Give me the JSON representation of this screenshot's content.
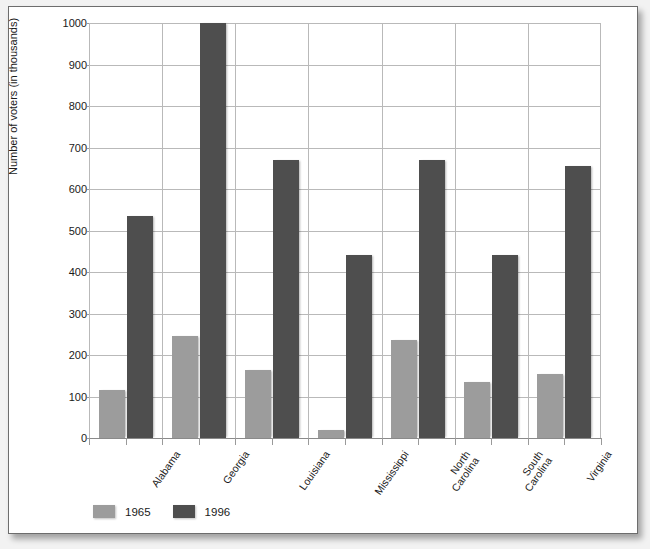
{
  "chart_data": {
    "type": "bar",
    "title": "",
    "xlabel": "",
    "ylabel": "Number of voters (in thousands)",
    "ylim": [
      0,
      1000
    ],
    "ytick_step": 100,
    "yticks": [
      "0",
      "100",
      "200",
      "300",
      "400",
      "500",
      "600",
      "700",
      "800",
      "900",
      "1000"
    ],
    "grid": true,
    "legend_position": "bottom-left",
    "categories": [
      "Alabama",
      "Georgia",
      "Louisiana",
      "Mississippi",
      "North Carolina",
      "South Carolina",
      "Virginia"
    ],
    "category_lines": [
      [
        "Alabama"
      ],
      [
        "Georgia"
      ],
      [
        "Louisiana"
      ],
      [
        "Mississippi"
      ],
      [
        "North",
        "Carolina"
      ],
      [
        "South",
        "Carolina"
      ],
      [
        "Virginia"
      ]
    ],
    "series": [
      {
        "name": "1965",
        "color": "#9c9c9c",
        "values": [
          115,
          245,
          165,
          20,
          235,
          135,
          155
        ]
      },
      {
        "name": "1996",
        "color": "#4e4e4e",
        "values": [
          535,
          1000,
          670,
          440,
          670,
          440,
          655
        ]
      }
    ]
  },
  "legend": {
    "items": [
      {
        "label": "1965",
        "color": "#9c9c9c"
      },
      {
        "label": "1996",
        "color": "#4e4e4e"
      }
    ]
  },
  "colors": {
    "series_1965": "#9c9c9c",
    "series_1996": "#4e4e4e",
    "gridline": "#b9b9b9",
    "axis": "#8a8a8a",
    "text": "#1a1a1a",
    "frame": "#6d6d6d",
    "page_background": "#f2f2f2",
    "sheet_background": "#ffffff"
  }
}
